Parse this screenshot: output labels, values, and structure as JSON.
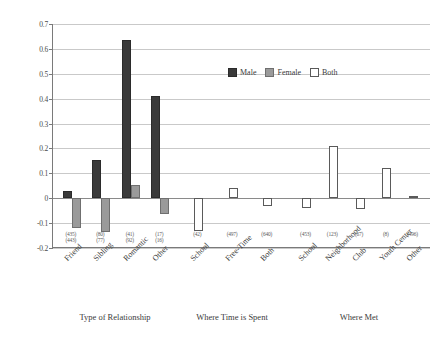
{
  "chart_data": {
    "type": "bar",
    "title": "",
    "xlabel": "",
    "ylabel": "",
    "ylim": [
      -0.2,
      0.7
    ],
    "ytick_labels": [
      "0.7",
      "0.6",
      "0.5",
      "0.4",
      "0.3",
      "0.2",
      "0.1",
      "0",
      "-0.1",
      "-0.2"
    ],
    "ytick_values": [
      0.7,
      0.6,
      0.5,
      0.4,
      0.3,
      0.2,
      0.1,
      0,
      -0.1,
      -0.2
    ],
    "grid": true,
    "legend_position": "top-center",
    "legend": [
      {
        "name": "Male",
        "color": "#3a3a3a"
      },
      {
        "name": "Female",
        "color": "#9a9a9a"
      },
      {
        "name": "Both",
        "color": "#ffffff"
      }
    ],
    "groups": [
      {
        "title": "Type of Relationship",
        "categories": [
          "Friend",
          "Sibling",
          "Romantic",
          "Other"
        ],
        "series": [
          {
            "name": "Male",
            "values": [
              0.03,
              0.155,
              0.635,
              0.41
            ]
          },
          {
            "name": "Female",
            "values": [
              -0.12,
              -0.135,
              0.055,
              -0.065
            ]
          }
        ],
        "sample_sizes": [
          {
            "male": "(435)",
            "female": "(443)"
          },
          {
            "male": "(80)",
            "female": "(77)"
          },
          {
            "male": "(41)",
            "female": "(92)"
          },
          {
            "male": "(17)",
            "female": "(16)"
          }
        ]
      },
      {
        "title": "Where Time is Spent",
        "categories": [
          "School",
          "Free-Time",
          "Both"
        ],
        "series": [
          {
            "name": "Both",
            "values": [
              -0.13,
              0.04,
              -0.03
            ]
          }
        ],
        "sample_sizes": [
          {
            "both": "(42)"
          },
          {
            "both": "(497)"
          },
          {
            "both": "(640)"
          }
        ]
      },
      {
        "title": "Where Met",
        "categories": [
          "School",
          "Neighborhood",
          "Club",
          "Youth Center",
          "Other"
        ],
        "series": [
          {
            "name": "Both",
            "values": [
              -0.04,
              0.21,
              -0.045,
              0.12,
              0.01
            ]
          }
        ],
        "sample_sizes": [
          {
            "both": "(453)"
          },
          {
            "both": "(123)"
          },
          {
            "both": "(67)"
          },
          {
            "both": "(8)"
          },
          {
            "both": "(496)"
          }
        ]
      }
    ]
  }
}
